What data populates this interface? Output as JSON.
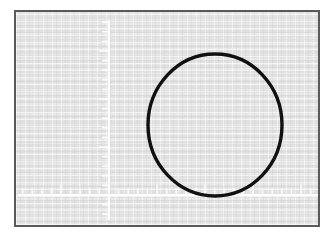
{
  "app": {
    "title": "Oscilloscope Display",
    "instrument": "oscilloscope-screen"
  },
  "screen": {
    "width": 334,
    "height": 239,
    "background_color": "#ffffff",
    "bezel_color": "#5a5a5a",
    "phosphor_color": "#e4e4e4"
  },
  "graticule": {
    "axis_color": "#ffffff",
    "axis_line_width": 2,
    "tick_color": "#ffffff",
    "tick_line_width": 1.4,
    "horizontal_axis": {
      "label": "time-base-axis",
      "y": 183,
      "x_start": 2,
      "x_end": 302,
      "tick_spacing": 9.6,
      "tick_length": 6,
      "tick_direction": "up",
      "major_tick_length": 9,
      "major_tick_every": 5
    },
    "vertical_axis": {
      "label": "amplitude-axis",
      "x": 93,
      "y_start": 8,
      "y_end": 208,
      "tick_spacing": 9.6,
      "tick_length": 6,
      "tick_direction": "left",
      "major_tick_length": 9,
      "major_tick_every": 5
    },
    "origin": {
      "x": 93,
      "y": 183
    }
  },
  "chart_data": {
    "type": "scatter",
    "title": "",
    "subtitle": "",
    "xlabel": "",
    "ylabel": "",
    "trace_name": "lissajous-circle",
    "trace_color": "#111111",
    "trace_width": 3.4,
    "shape": "circle",
    "center_x": 199,
    "center_y": 113,
    "radius_x": 67,
    "radius_y": 71,
    "grid": false,
    "legend": "none",
    "annotations": []
  }
}
